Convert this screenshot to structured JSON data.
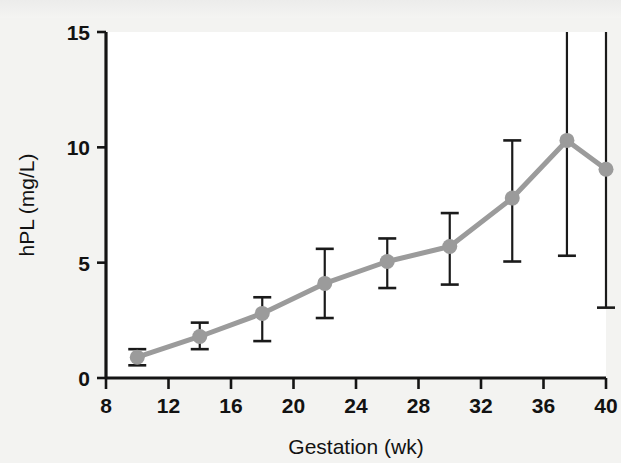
{
  "figure": {
    "background_color": "#f3f3f1",
    "plot_background_color": "#ffffff",
    "axis_color": "#141414",
    "series_color": "#9b9b9b",
    "errorbar_color": "#1a1a1a"
  },
  "chart_data": {
    "type": "line",
    "title": "",
    "subtitle": "",
    "xlabel": "Gestation (wk)",
    "ylabel": "hPL (mg/L)",
    "xlim": [
      8,
      40
    ],
    "ylim": [
      0,
      15
    ],
    "xticks": [
      8,
      12,
      16,
      20,
      24,
      28,
      32,
      36,
      40
    ],
    "xtick_labels": [
      "8",
      "12",
      "16",
      "20",
      "24",
      "28",
      "32",
      "36",
      "40"
    ],
    "yticks": [
      0,
      5,
      10,
      15
    ],
    "ytick_labels": [
      "0",
      "5",
      "10",
      "15"
    ],
    "grid": false,
    "legend": null,
    "marker": "circle",
    "errorbar_style": "capped-vertical",
    "series": [
      {
        "name": "hPL",
        "x": [
          10,
          14,
          18,
          22,
          26,
          30,
          34,
          37.5,
          40
        ],
        "values": [
          0.9,
          1.8,
          2.8,
          4.1,
          5.05,
          5.7,
          7.8,
          10.3,
          9.05
        ],
        "err_low": [
          0.55,
          1.25,
          1.6,
          2.6,
          3.9,
          4.05,
          5.05,
          5.3,
          3.05
        ],
        "err_high": [
          1.25,
          2.4,
          3.5,
          5.6,
          6.05,
          7.15,
          10.3,
          15.2,
          15.2
        ],
        "err_high_clipped": [
          false,
          false,
          false,
          false,
          false,
          false,
          false,
          true,
          true
        ]
      }
    ],
    "annotations": []
  }
}
